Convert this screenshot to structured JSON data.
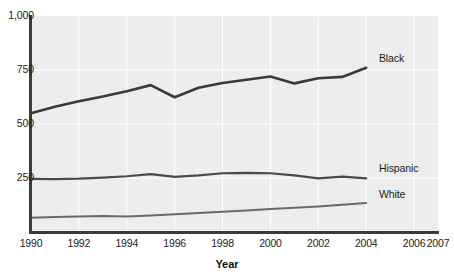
{
  "chart_data": {
    "type": "line",
    "title": "",
    "xlabel": "Year",
    "ylabel": "",
    "xlim": [
      1990,
      2007
    ],
    "ylim": [
      0,
      1000
    ],
    "grid": true,
    "legend_position": "inline-right",
    "x": [
      1990,
      1991,
      1992,
      1993,
      1994,
      1995,
      1996,
      1997,
      1998,
      1999,
      2000,
      2001,
      2002,
      2003,
      2004
    ],
    "xticks": [
      "1990",
      "1992",
      "1994",
      "1996",
      "1998",
      "2000",
      "2002",
      "2004",
      "2006",
      "2007"
    ],
    "xtick_values": [
      1990,
      1992,
      1994,
      1996,
      1998,
      2000,
      2002,
      2004,
      2006,
      2007
    ],
    "yticks": [
      "1,000",
      "750",
      "500",
      "250"
    ],
    "ytick_values": [
      1000,
      750,
      500,
      250
    ],
    "series": [
      {
        "name": "Black",
        "color": "#3a3a3a",
        "width": 2.6,
        "label_x": 2004.45,
        "label_y": 800,
        "values": [
          550,
          580,
          605,
          627,
          652,
          680,
          624,
          668,
          690,
          705,
          720,
          688,
          712,
          718,
          760
        ]
      },
      {
        "name": "Hispanic",
        "color": "#4a4a4a",
        "width": 2.2,
        "label_x": 2004.45,
        "label_y": 290,
        "values": [
          246,
          245,
          247,
          252,
          258,
          268,
          255,
          262,
          272,
          274,
          272,
          262,
          248,
          256,
          248
        ]
      },
      {
        "name": "White",
        "color": "#6a6a6a",
        "width": 2.0,
        "label_x": 2004.45,
        "label_y": 170,
        "values": [
          66,
          70,
          72,
          74,
          72,
          76,
          82,
          88,
          94,
          100,
          106,
          112,
          118,
          126,
          134
        ]
      }
    ]
  },
  "axis": {
    "x_title": "Year"
  }
}
